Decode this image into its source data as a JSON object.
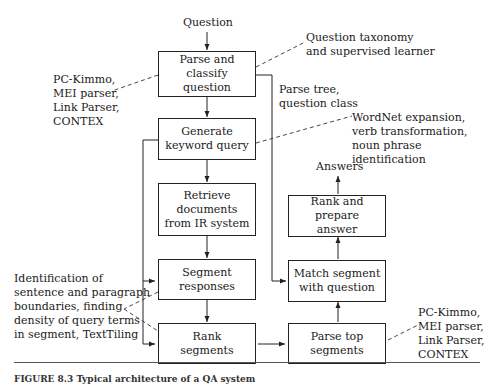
{
  "figure": {
    "input_label": "Question",
    "output_label": "Answers",
    "caption": "FIGURE 8.3  Typical architecture of a QA system",
    "boxes": {
      "parse_classify": "Parse and classify\nquestion",
      "generate_query": "Generate\nkeyword query",
      "retrieve": "Retrieve\ndocuments\nfrom IR system",
      "segment": "Segment\nresponses",
      "rank_segments": "Rank\nsegments",
      "parse_top": "Parse top\nsegments",
      "match": "Match segment\nwith question",
      "rank_answer": "Rank and prepare\nanswer"
    },
    "annotations": {
      "taxonomy": "Question taxonomy\nand supervised learner",
      "parsers_left": "PC-Kimmo,\nMEI parser,\nLink Parser,\nCONTEX",
      "parse_tree": "Parse tree,\nquestion class",
      "wordnet": "WordNet expansion,\nverb transformation,\nnoun phrase identification",
      "segmentation": "Identification of\nsentence and paragraph\nboundaries, finding\ndensity of query terms\nin segment, TextTiling",
      "parsers_right": "PC-Kimmo,\nMEI parser,\nLink Parser,\nCONTEX"
    }
  }
}
